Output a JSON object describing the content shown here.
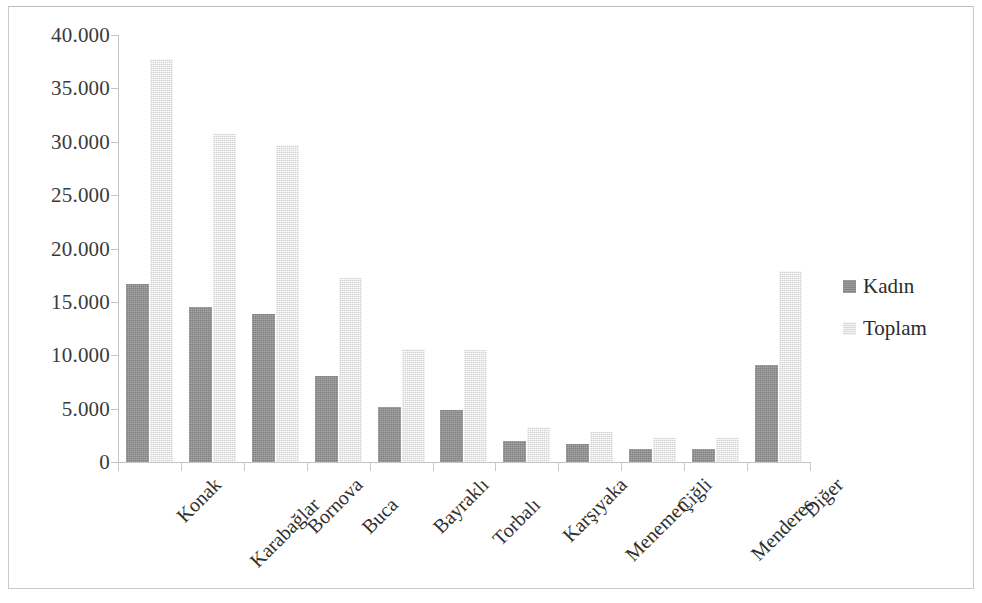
{
  "chart_data": {
    "type": "bar",
    "title": "",
    "subtitle": "",
    "xlabel": "",
    "ylabel": "",
    "grid": false,
    "legend_position": "right",
    "categories": [
      "Konak",
      "Karabağlar",
      "Bornova",
      "Buca",
      "Bayraklı",
      "Torbalı",
      "Karşıyaka",
      "Menemen",
      "Çiğli",
      "Menderes",
      "Diğer"
    ],
    "ylim": [
      0,
      40000
    ],
    "ytick_values": [
      0,
      5000,
      10000,
      15000,
      20000,
      25000,
      30000,
      35000,
      40000
    ],
    "ytick_labels": [
      "0",
      "5.000",
      "10.000",
      "15.000",
      "20.000",
      "25.000",
      "30.000",
      "35.000",
      "40.000"
    ],
    "series": [
      {
        "name": "Kadın",
        "color": "#8d8d8d",
        "values": [
          16700,
          14500,
          13900,
          8100,
          5200,
          4900,
          1950,
          1650,
          1250,
          1250,
          9100
        ]
      },
      {
        "name": "Toplam",
        "color": "#ebebeb",
        "values": [
          37800,
          30700,
          29700,
          17200,
          10600,
          10500,
          3300,
          2850,
          2250,
          2250,
          17900
        ]
      }
    ]
  },
  "legend": {
    "items": [
      {
        "label": "Kadın"
      },
      {
        "label": "Toplam"
      }
    ]
  }
}
